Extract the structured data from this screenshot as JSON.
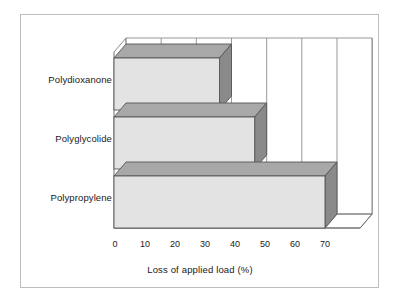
{
  "chart_data": {
    "type": "bar",
    "orientation": "horizontal",
    "style": "3d",
    "title": "",
    "xlabel": "Loss of applied load (%)",
    "ylabel": "",
    "categories": [
      "Polydioxanone",
      "Polyglycolide",
      "Polypropylene"
    ],
    "values": [
      30,
      40,
      60
    ],
    "xlim": [
      0,
      70
    ],
    "xticks": [
      0,
      10,
      20,
      30,
      40,
      50,
      60,
      70
    ],
    "xtick_labels": [
      "0",
      "10",
      "20",
      "30",
      "40",
      "50",
      "60",
      "70"
    ],
    "grid": "vertical-backwall",
    "legend": null,
    "series": [
      {
        "name": "Loss of applied load (%)",
        "values": [
          30,
          40,
          60
        ]
      }
    ]
  },
  "colors": {
    "bar_front": "#e3e3e3",
    "bar_top": "#a8a8a8",
    "bar_side": "#8a8a8a",
    "outline": "#555555",
    "gridline": "#8d8d8d",
    "axis": "#6e6e6e",
    "frame": "#bdbdbd",
    "background": "#ffffff",
    "text": "#1a1a1a"
  },
  "figure": {
    "border_label": "chart-frame"
  }
}
